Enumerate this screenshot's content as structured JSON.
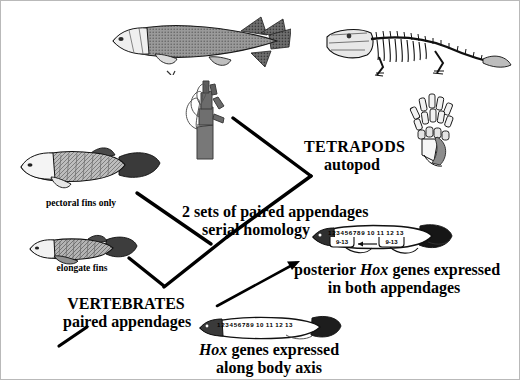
{
  "figure": {
    "background_color": "#ffffff",
    "border_color": "#b9b9b9",
    "ink_color": "#000000"
  },
  "labels": {
    "pectoral_fins": "pectoral fins only",
    "elongate_fins": "elongate fins",
    "vertebrates_title": "VERTEBRATES",
    "vertebrates_sub": "paired appendages",
    "two_sets_line1": "2 sets of paired appendages",
    "two_sets_line2": "serial homology",
    "tetrapods_title": "TETRAPODS",
    "tetrapods_sub": "autopod",
    "posterior_hox_line1_a": "posterior ",
    "posterior_hox_line1_b": "Hox",
    "posterior_hox_line1_c": " genes expressed",
    "posterior_hox_line2": "in both appendages",
    "body_axis_line1_a": "Hox",
    "body_axis_line1_b": " genes expressed",
    "body_axis_line2": "along body axis"
  },
  "organisms": {
    "lobe_finned_fish": "lobe-finned-fish-illustration",
    "tetrapod_skeleton": "tetrapod-skeleton-illustration",
    "limb_fin_skeleton": "fin-limb-skeleton-illustration",
    "autopod_foot": "autopod-foot-skeleton-illustration",
    "pectoral_fin_fish": "pectoral-fin-fish-illustration",
    "elongate_fin_fish": "elongate-fin-fish-illustration",
    "hox_fish_body_axis": "hox-body-axis-fish-illustration",
    "hox_fish_appendages": "hox-both-appendages-fish-illustration"
  },
  "hox_body_axis_fish": {
    "numbers": [
      "1",
      "2",
      "3",
      "4",
      "5",
      "6",
      "7",
      "8",
      "9",
      "10",
      "11",
      "12",
      "13"
    ]
  },
  "hox_appendages_fish": {
    "numbers": [
      "1",
      "2",
      "3",
      "4",
      "5",
      "6",
      "7",
      "8",
      "9",
      "10",
      "11",
      "12",
      "13"
    ],
    "bracket_left_label": "9-13",
    "bracket_right_label": "9-13",
    "arrow_direction": "left"
  },
  "connectors": [
    {
      "name": "branch-pectoral-to-node",
      "from": "pectoral fins only",
      "to": "internal node"
    },
    {
      "name": "branch-elongate-to-node",
      "from": "elongate fins",
      "to": "internal node"
    },
    {
      "name": "branch-node-to-serial-homology",
      "from": "internal node",
      "to": "2 sets of paired appendages"
    },
    {
      "name": "branch-serial-homology-to-tetrapods",
      "from": "2 sets of paired appendages",
      "to": "TETRAPODS autopod"
    },
    {
      "name": "arrow-vertebrates-to-posterior-hox",
      "from": "VERTEBRATES",
      "to": "posterior Hox genes expressed"
    },
    {
      "name": "tick-below-vertebrates",
      "from": "VERTEBRATES",
      "to": "root"
    }
  ]
}
